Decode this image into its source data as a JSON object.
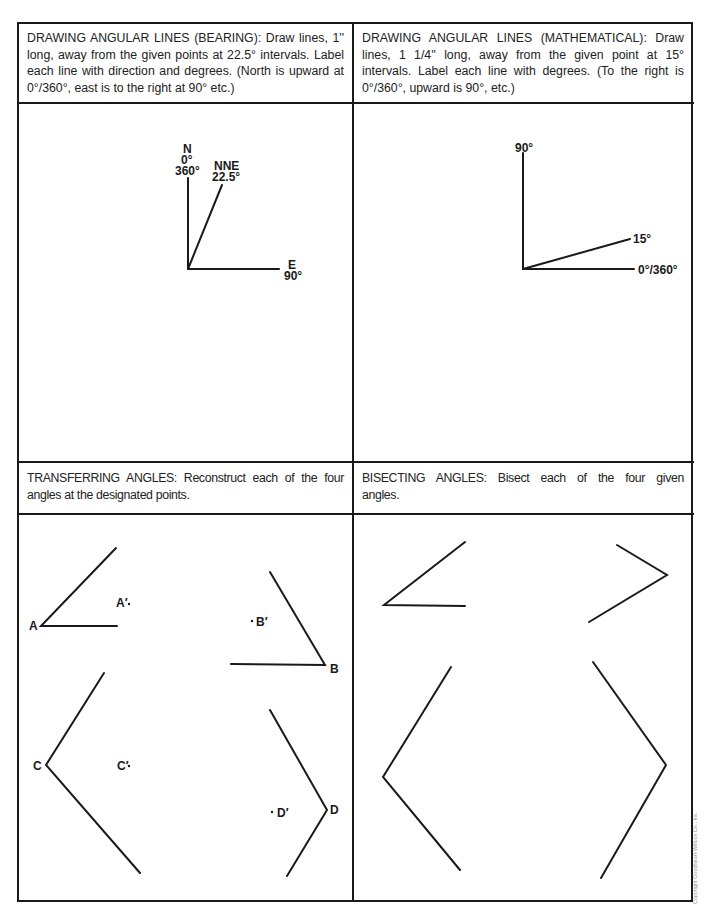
{
  "panels": {
    "bearing": {
      "title": "DRAWING ANGULAR LINES (BEARING): Draw lines, 1'' long, away from the given points at 22.5° intervals. Label each line with direction and degrees. (North is upward at 0°/360°, east is to the right at 90° etc.)",
      "labels": {
        "north_dir": "N",
        "north_deg1": "0°",
        "north_deg2": "360°",
        "nne_dir": "NNE",
        "nne_deg": "22.5°",
        "east_dir": "E",
        "east_deg": "90°"
      }
    },
    "mathematical": {
      "title": "DRAWING ANGULAR LINES (MATHEMATICAL): Draw lines, 1 1/4'' long, away from the given point at 15° intervals. Label each line with degrees. (To the right is 0°/360°, upward is 90°, etc.)",
      "labels": {
        "up": "90°",
        "fifteen": "15°",
        "right": "0°/360°"
      }
    },
    "transferring": {
      "title": "TRANSFERRING ANGLES: Reconstruct each of the four angles at the designated points.",
      "labels": {
        "a": "A",
        "a_prime": "A′",
        "b": "B",
        "b_prime": "B′",
        "c": "C",
        "c_prime": "C′",
        "d": "D",
        "d_prime": "D′"
      }
    },
    "bisecting": {
      "title": "BISECTING ANGLES: Bisect each of the four given angles."
    }
  },
  "footer": {
    "copyright": "Copyright Goodheart-Willcox Co., Inc."
  }
}
